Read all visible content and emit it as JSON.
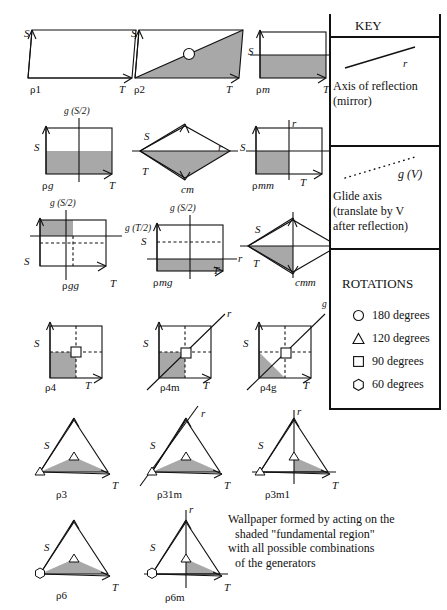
{
  "figure": {
    "shade_color": "#a8a8a8",
    "line_color": "#111111"
  },
  "cells": [
    {
      "id": "p1",
      "name": "p1",
      "label_rho": "ρ",
      "label_rest": "1",
      "vecS": "S",
      "vecT": "T",
      "extra": []
    },
    {
      "id": "p2",
      "name": "p2",
      "label_rho": "ρ",
      "label_rest": "2",
      "vecS": "S",
      "vecT": "T",
      "extra": []
    },
    {
      "id": "pm",
      "name": "pm",
      "label_rho": "ρ",
      "label_rest": "m",
      "vecS": "S",
      "vecT": "T",
      "extra": [
        "r"
      ]
    },
    {
      "id": "pg",
      "name": "pg",
      "label_rho": "ρ",
      "label_rest": "g",
      "vecS": "S",
      "vecT": "T",
      "extra": [
        "g (S/2)"
      ]
    },
    {
      "id": "cm",
      "name": "cm",
      "label_rho": "",
      "label_rest": "cm",
      "vecS": "S",
      "vecT": "T",
      "extra": [
        "r"
      ]
    },
    {
      "id": "pmm",
      "name": "pmm",
      "label_rho": "ρ",
      "label_rest": "mm",
      "vecS": "S",
      "vecT": "T",
      "extra": [
        "r",
        "r"
      ]
    },
    {
      "id": "pgg",
      "name": "pgg",
      "label_rho": "ρ",
      "label_rest": "gg",
      "vecS": "S",
      "vecT": "T",
      "extra": [
        "g (S/2)",
        "g (T/2)"
      ]
    },
    {
      "id": "pmg",
      "name": "pmg",
      "label_rho": "ρ",
      "label_rest": "mg",
      "vecS": "S",
      "vecT": "T",
      "extra": [
        "g (S/2)",
        "r"
      ]
    },
    {
      "id": "cmm",
      "name": "cmm",
      "label_rho": "",
      "label_rest": "cmm",
      "vecS": "S",
      "vecT": "T",
      "extra": []
    },
    {
      "id": "p4",
      "name": "p4",
      "label_rho": "ρ",
      "label_rest": "4",
      "vecS": "S",
      "vecT": "T",
      "extra": []
    },
    {
      "id": "p4m",
      "name": "p4m",
      "label_rho": "ρ",
      "label_rest": "4m",
      "vecS": "S",
      "vecT": "T",
      "extra": [
        "r"
      ]
    },
    {
      "id": "p4g",
      "name": "p4g",
      "label_rho": "ρ",
      "label_rest": "4g",
      "vecS": "S",
      "vecT": "T",
      "extra": [
        "g (S/2+T/2)"
      ]
    },
    {
      "id": "p3",
      "name": "p3",
      "label_rho": "ρ",
      "label_rest": "3",
      "vecS": "S",
      "vecT": "T",
      "extra": []
    },
    {
      "id": "p31m",
      "name": "p31m",
      "label_rho": "ρ",
      "label_rest": "31m",
      "vecS": "S",
      "vecT": "T",
      "extra": [
        "r"
      ]
    },
    {
      "id": "p3m1",
      "name": "p3m1",
      "label_rho": "ρ",
      "label_rest": "3m1",
      "vecS": "S",
      "vecT": "T",
      "extra": [
        "r"
      ]
    },
    {
      "id": "p6",
      "name": "p6",
      "label_rho": "ρ",
      "label_rest": "6",
      "vecS": "S",
      "vecT": "T",
      "extra": []
    },
    {
      "id": "p6m",
      "name": "p6m",
      "label_rho": "ρ",
      "label_rest": "6m",
      "vecS": "S",
      "vecT": "T",
      "extra": [
        "r"
      ]
    }
  ],
  "labels": {
    "S": "S",
    "T": "T",
    "r": "r",
    "g_S2": "g (S/2)",
    "g_T2": "g (T/2)",
    "g_S2T2": "g (S/2+T/2)",
    "p1": "ρ1",
    "p2": "ρ2",
    "pm_rho": "ρ",
    "pm_rest": "m",
    "pg_rho": "ρ",
    "pg_rest": "g",
    "cm": "cm",
    "pmm_rho": "ρ",
    "pmm_rest": "mm",
    "pgg_rho": "ρ",
    "pgg_rest": "gg",
    "pmg_rho": "ρ",
    "pmg_rest": "mg",
    "cmm": "cmm",
    "p4": "ρ4",
    "p4m": "ρ4m",
    "p4g": "ρ4g",
    "p3": "ρ3",
    "p31m": "ρ31m",
    "p3m1": "ρ3m1",
    "p6": "ρ6",
    "p6m": "ρ6m"
  },
  "key": {
    "title": "KEY",
    "mirror": {
      "glyph_label": "r",
      "line1": "Axis of reflection",
      "line2": "(mirror)"
    },
    "glide": {
      "glyph_label": "g (V)",
      "line1": "Glide axis",
      "line2": "(translate by V",
      "line3": "after reflection)"
    },
    "rotations": {
      "title": "ROTATIONS",
      "items": [
        {
          "icon": "circle-icon",
          "label": "180 degrees"
        },
        {
          "icon": "triangle-icon",
          "label": "120 degrees"
        },
        {
          "icon": "square-icon",
          "label": "90 degrees"
        },
        {
          "icon": "hexagon-icon",
          "label": "60 degrees"
        }
      ]
    }
  },
  "caption": {
    "line1": "Wallpaper formed by acting on the",
    "line2": "shaded \"fundamental region\"",
    "line3": "with all possible combinations",
    "line4": "of the generators"
  }
}
